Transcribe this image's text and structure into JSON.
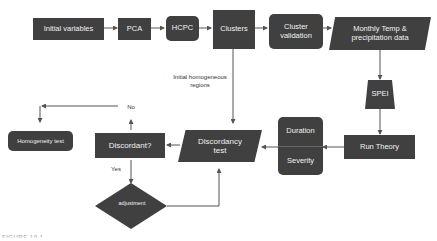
{
  "diagram": {
    "nodes": {
      "initial_variables": "Initial variables",
      "pca": "PCA",
      "hcpc": "HCPC",
      "clusters": "Clusters",
      "cluster_validation_1": "Cluster",
      "cluster_validation_2": "validation",
      "monthly_data_1": "Monthly Temp &",
      "monthly_data_2": "precipitation data",
      "spei": "SPEI",
      "run_theory": "Run Theory",
      "duration": "Duration",
      "severity": "Severity",
      "discordancy_test_1": "Discordancy",
      "discordancy_test_2": "test",
      "discordant": "Discordant?",
      "homogeneity_test": "Homogeneity test",
      "adjustment": "adjustment"
    },
    "edge_labels": {
      "initial_regions_1": "Initial homogeneous",
      "initial_regions_2": "regions",
      "no": "No",
      "yes": "Yes"
    },
    "caption": "FIGURE 10.1"
  },
  "colors": {
    "node_fill": "#404040",
    "node_text": "#f2f2f2",
    "arrow": "#555555"
  }
}
